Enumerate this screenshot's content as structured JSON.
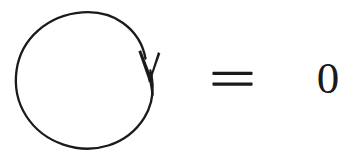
{
  "figure": {
    "kind": "math-expression",
    "background_color": "#ffffff",
    "ink_color": "#1a1a1a",
    "width": 357,
    "height": 156
  },
  "expression": {
    "plain_text": "∮ = 0",
    "left_operand": {
      "name": "oriented-circle",
      "symbol": "↻",
      "orientation": "clockwise",
      "center_x": 84,
      "center_y": 81,
      "radius": 68,
      "stroke_width": 2.2
    },
    "relation": {
      "name": "equals",
      "symbol": "=",
      "bar_count": 2,
      "x_start": 212,
      "x_end": 252,
      "bar_top_y": 73,
      "bar_bottom_y": 84,
      "bar_thickness": 3
    },
    "right_operand": {
      "name": "zero",
      "value": "0",
      "x": 318,
      "y": 62,
      "font_size": 45
    },
    "arrowhead": {
      "name": "clockwise-arrowhead",
      "tip_x": 150,
      "tip_y": 80,
      "direction": "down",
      "barb_length": 26
    }
  }
}
